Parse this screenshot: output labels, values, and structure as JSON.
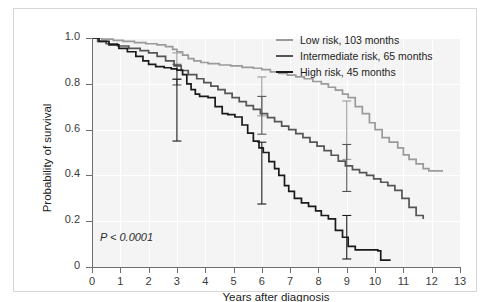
{
  "figure": {
    "ytitle": "Probability of survival",
    "xtitle": "Years after diagnosis",
    "pvalue": "P < 0.0001"
  },
  "legend": [
    {
      "label": "Low risk, 103 months",
      "color": "#9a9a9a"
    },
    {
      "label": "Intermediate risk, 65 months",
      "color": "#555555"
    },
    {
      "label": "High risk, 45 months",
      "color": "#1a1a1a"
    }
  ],
  "axes": {
    "xticks": [
      "0",
      "1",
      "2",
      "3",
      "4",
      "5",
      "6",
      "7",
      "8",
      "9",
      "10",
      "11",
      "12",
      "13"
    ],
    "yticks": [
      "0",
      "0.2",
      "0.4",
      "0.6",
      "0.8",
      "1.0"
    ]
  },
  "chart_data": {
    "type": "line",
    "title": "",
    "xlabel": "Years after diagnosis",
    "ylabel": "Probability of survival",
    "xlim": [
      0,
      13
    ],
    "ylim": [
      0,
      1.0
    ],
    "xticks": [
      0,
      1,
      2,
      3,
      4,
      5,
      6,
      7,
      8,
      9,
      10,
      11,
      12,
      13
    ],
    "yticks": [
      0,
      0.2,
      0.4,
      0.6,
      0.8,
      1.0
    ],
    "grid": true,
    "legend_position": "top-right",
    "annotations": [
      {
        "text": "P < 0.0001",
        "x": 0.3,
        "y": 0.06
      }
    ],
    "curve_style": "step",
    "series": [
      {
        "name": "Low risk, 103 months",
        "median_survival_months": 103,
        "color": "#9a9a9a",
        "points": [
          [
            0,
            1.0
          ],
          [
            0.35,
            0.995
          ],
          [
            0.75,
            0.99
          ],
          [
            1.1,
            0.985
          ],
          [
            1.5,
            0.98
          ],
          [
            1.9,
            0.975
          ],
          [
            2.3,
            0.97
          ],
          [
            2.6,
            0.962
          ],
          [
            2.85,
            0.95
          ],
          [
            3.0,
            0.94
          ],
          [
            3.2,
            0.925
          ],
          [
            3.4,
            0.91
          ],
          [
            3.6,
            0.9
          ],
          [
            3.85,
            0.893
          ],
          [
            4.1,
            0.888
          ],
          [
            4.5,
            0.882
          ],
          [
            4.9,
            0.878
          ],
          [
            5.3,
            0.872
          ],
          [
            5.7,
            0.868
          ],
          [
            6.0,
            0.862
          ],
          [
            6.3,
            0.852
          ],
          [
            6.6,
            0.845
          ],
          [
            6.9,
            0.838
          ],
          [
            7.2,
            0.83
          ],
          [
            7.5,
            0.822
          ],
          [
            7.8,
            0.81
          ],
          [
            8.1,
            0.8
          ],
          [
            8.35,
            0.785
          ],
          [
            8.6,
            0.772
          ],
          [
            8.85,
            0.755
          ],
          [
            9.05,
            0.74
          ],
          [
            9.3,
            0.7
          ],
          [
            9.55,
            0.67
          ],
          [
            9.8,
            0.63
          ],
          [
            10.0,
            0.6
          ],
          [
            10.25,
            0.565
          ],
          [
            10.5,
            0.545
          ],
          [
            10.8,
            0.52
          ],
          [
            11.0,
            0.49
          ],
          [
            11.2,
            0.47
          ],
          [
            11.45,
            0.45
          ],
          [
            11.7,
            0.43
          ],
          [
            11.9,
            0.42
          ],
          [
            12.4,
            0.42
          ]
        ],
        "error_bars": [
          {
            "x": 3.0,
            "y": 0.88,
            "low": 0.82,
            "high": 0.935
          },
          {
            "x": 6.0,
            "y": 0.745,
            "low": 0.66,
            "high": 0.83
          },
          {
            "x": 9.0,
            "y": 0.6,
            "low": 0.47,
            "high": 0.725
          }
        ]
      },
      {
        "name": "Intermediate risk, 65 months",
        "median_survival_months": 65,
        "color": "#555555",
        "points": [
          [
            0,
            1.0
          ],
          [
            0.2,
            0.985
          ],
          [
            0.5,
            0.975
          ],
          [
            0.9,
            0.965
          ],
          [
            1.3,
            0.955
          ],
          [
            1.7,
            0.945
          ],
          [
            2.0,
            0.935
          ],
          [
            2.3,
            0.92
          ],
          [
            2.6,
            0.9
          ],
          [
            2.9,
            0.878
          ],
          [
            3.15,
            0.858
          ],
          [
            3.4,
            0.84
          ],
          [
            3.7,
            0.822
          ],
          [
            3.95,
            0.805
          ],
          [
            4.2,
            0.79
          ],
          [
            4.45,
            0.775
          ],
          [
            4.7,
            0.758
          ],
          [
            4.95,
            0.74
          ],
          [
            5.2,
            0.722
          ],
          [
            5.45,
            0.705
          ],
          [
            5.7,
            0.688
          ],
          [
            5.95,
            0.67
          ],
          [
            6.2,
            0.652
          ],
          [
            6.45,
            0.635
          ],
          [
            6.7,
            0.615
          ],
          [
            6.95,
            0.6
          ],
          [
            7.2,
            0.582
          ],
          [
            7.45,
            0.565
          ],
          [
            7.7,
            0.545
          ],
          [
            7.95,
            0.528
          ],
          [
            8.2,
            0.508
          ],
          [
            8.45,
            0.488
          ],
          [
            8.7,
            0.462
          ],
          [
            8.95,
            0.442
          ],
          [
            9.2,
            0.425
          ],
          [
            9.45,
            0.412
          ],
          [
            9.7,
            0.4
          ],
          [
            9.95,
            0.385
          ],
          [
            10.2,
            0.37
          ],
          [
            10.45,
            0.355
          ],
          [
            10.7,
            0.335
          ],
          [
            10.95,
            0.3
          ],
          [
            11.2,
            0.26
          ],
          [
            11.45,
            0.225
          ],
          [
            11.7,
            0.21
          ]
        ],
        "error_bars": [
          {
            "x": 3.0,
            "y": 0.845,
            "low": 0.795,
            "high": 0.885
          },
          {
            "x": 6.0,
            "y": 0.665,
            "low": 0.58,
            "high": 0.745
          },
          {
            "x": 9.0,
            "y": 0.435,
            "low": 0.33,
            "high": 0.535
          }
        ]
      },
      {
        "name": "High risk, 45 months",
        "median_survival_months": 45,
        "color": "#1a1a1a",
        "points": [
          [
            0,
            1.0
          ],
          [
            0.25,
            0.985
          ],
          [
            0.6,
            0.97
          ],
          [
            0.95,
            0.955
          ],
          [
            1.25,
            0.94
          ],
          [
            1.55,
            0.92
          ],
          [
            1.8,
            0.9
          ],
          [
            2.0,
            0.885
          ],
          [
            2.25,
            0.875
          ],
          [
            2.55,
            0.87
          ],
          [
            2.8,
            0.865
          ],
          [
            3.0,
            0.86
          ],
          [
            3.2,
            0.84
          ],
          [
            3.35,
            0.8
          ],
          [
            3.5,
            0.775
          ],
          [
            3.65,
            0.755
          ],
          [
            3.8,
            0.745
          ],
          [
            4.1,
            0.74
          ],
          [
            4.35,
            0.7
          ],
          [
            4.6,
            0.67
          ],
          [
            4.8,
            0.665
          ],
          [
            5.05,
            0.655
          ],
          [
            5.3,
            0.62
          ],
          [
            5.5,
            0.585
          ],
          [
            5.7,
            0.55
          ],
          [
            5.9,
            0.52
          ],
          [
            6.05,
            0.5
          ],
          [
            6.25,
            0.46
          ],
          [
            6.45,
            0.43
          ],
          [
            6.6,
            0.4
          ],
          [
            6.8,
            0.355
          ],
          [
            6.95,
            0.33
          ],
          [
            7.15,
            0.3
          ],
          [
            7.4,
            0.28
          ],
          [
            7.65,
            0.265
          ],
          [
            7.9,
            0.245
          ],
          [
            8.1,
            0.225
          ],
          [
            8.35,
            0.21
          ],
          [
            8.6,
            0.16
          ],
          [
            8.85,
            0.13
          ],
          [
            9.05,
            0.09
          ],
          [
            9.3,
            0.075
          ],
          [
            10.1,
            0.07
          ],
          [
            10.2,
            0.03
          ],
          [
            10.55,
            0.03
          ]
        ],
        "error_bars": [
          {
            "x": 3.0,
            "y": 0.72,
            "low": 0.55,
            "high": 0.82
          },
          {
            "x": 6.0,
            "y": 0.505,
            "low": 0.275,
            "high": 0.545
          },
          {
            "x": 9.0,
            "y": 0.135,
            "low": 0.035,
            "high": 0.225
          }
        ]
      }
    ]
  }
}
